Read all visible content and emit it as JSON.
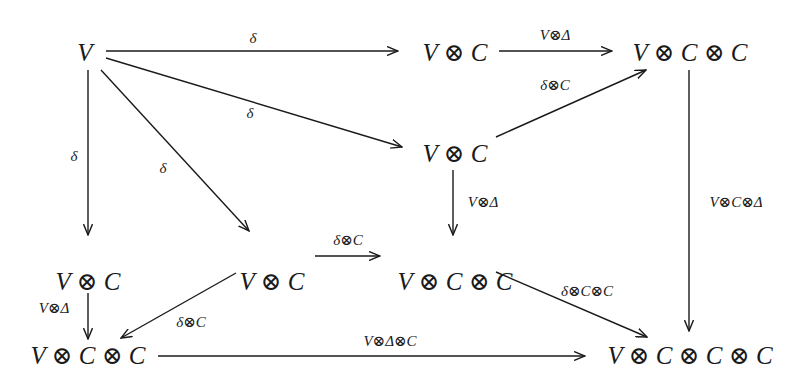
{
  "diagram": {
    "type": "commutative-diagram",
    "colors": {
      "ink": "#1a1a1a",
      "background": "#ffffff"
    },
    "nodes": [
      {
        "id": "n_V",
        "label": "V",
        "x": 85,
        "y": 52
      },
      {
        "id": "n_VC_top",
        "label": "V ⊗ C",
        "x": 455,
        "y": 52
      },
      {
        "id": "n_VCC_topright",
        "label": "V ⊗ C ⊗ C",
        "x": 690,
        "y": 52
      },
      {
        "id": "n_VC_mid",
        "label": "V ⊗ C",
        "x": 455,
        "y": 153
      },
      {
        "id": "n_VC_left",
        "label": "V ⊗ C",
        "x": 88,
        "y": 281
      },
      {
        "id": "n_VC_center",
        "label": "V ⊗ C",
        "x": 272,
        "y": 281
      },
      {
        "id": "n_VCC_center",
        "label": "V ⊗ C ⊗ C",
        "x": 455,
        "y": 281
      },
      {
        "id": "n_VCC_bottomleft",
        "label": "V ⊗ C ⊗ C",
        "x": 88,
        "y": 355
      },
      {
        "id": "n_VCCC_bottomright",
        "label": "V ⊗ C ⊗ C ⊗ C",
        "x": 690,
        "y": 355
      }
    ],
    "edges": [
      {
        "id": "e1",
        "from": "n_V",
        "to": "n_VC_top",
        "label": "δ",
        "x1": 106,
        "y1": 51,
        "x2": 398,
        "y2": 51,
        "lx": 253,
        "ly": 38
      },
      {
        "id": "e2",
        "from": "n_VC_top",
        "to": "n_VCC_topright",
        "label": "V⊗Δ",
        "x1": 499,
        "y1": 51,
        "x2": 612,
        "y2": 51,
        "lx": 555,
        "ly": 35
      },
      {
        "id": "e3",
        "from": "n_V",
        "to": "n_VC_mid",
        "label": "δ",
        "x1": 106,
        "y1": 58,
        "x2": 402,
        "y2": 147,
        "lx": 250,
        "ly": 113
      },
      {
        "id": "e4",
        "from": "n_VC_mid",
        "to": "n_VCC_topright",
        "label": "δ⊗C",
        "x1": 496,
        "y1": 137,
        "x2": 646,
        "y2": 70,
        "lx": 555,
        "ly": 85
      },
      {
        "id": "e5",
        "from": "n_V",
        "to": "n_VC_left",
        "label": "δ",
        "x1": 88,
        "y1": 70,
        "x2": 88,
        "y2": 235,
        "lx": 74,
        "ly": 156
      },
      {
        "id": "e6",
        "from": "n_V",
        "to": "n_VC_center",
        "label": "δ",
        "x1": 101,
        "y1": 70,
        "x2": 249,
        "y2": 231,
        "lx": 163,
        "ly": 168
      },
      {
        "id": "e7",
        "from": "n_VC_mid",
        "to": "n_VCC_center",
        "label": "V⊗Δ",
        "x1": 453,
        "y1": 170,
        "x2": 453,
        "y2": 235,
        "lx": 483,
        "ly": 202
      },
      {
        "id": "e8",
        "from": "n_VCC_topright",
        "to": "n_VCCC_bottomright",
        "label": "V⊗C⊗Δ",
        "x1": 689,
        "y1": 70,
        "x2": 689,
        "y2": 331,
        "lx": 736,
        "ly": 202
      },
      {
        "id": "e9",
        "from": "n_VC_center",
        "to": "n_VCC_center",
        "label": "δ⊗C",
        "x1": 315,
        "y1": 256,
        "x2": 380,
        "y2": 256,
        "lx": 348,
        "ly": 240
      },
      {
        "id": "e10",
        "from": "n_VC_left",
        "to": "n_VCC_bottomleft",
        "label": "V⊗Δ",
        "x1": 88,
        "y1": 293,
        "x2": 88,
        "y2": 339,
        "lx": 54,
        "ly": 308
      },
      {
        "id": "e11",
        "from": "n_VC_center",
        "to": "n_VCC_bottomleft",
        "label": "δ⊗C",
        "x1": 236,
        "y1": 273,
        "x2": 121,
        "y2": 338,
        "lx": 191,
        "ly": 322
      },
      {
        "id": "e12",
        "from": "n_VCC_bottomleft",
        "to": "n_VCCC_bottomright",
        "label": "V⊗Δ⊗C",
        "x1": 158,
        "y1": 356,
        "x2": 585,
        "y2": 356,
        "lx": 390,
        "ly": 341
      },
      {
        "id": "e13",
        "from": "n_VCC_center",
        "to": "n_VCCC_bottomright",
        "label": "δ⊗C⊗C",
        "x1": 496,
        "y1": 272,
        "x2": 647,
        "y2": 337,
        "lx": 587,
        "ly": 291
      }
    ]
  }
}
